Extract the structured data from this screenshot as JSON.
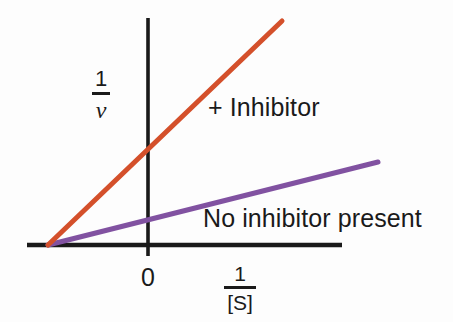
{
  "figure": {
    "kind": "lineweaver-burk-plot",
    "background_color": "#fdfdfd",
    "axis_color": "#1a1a1a",
    "origin_label": "0",
    "y_axis_label": {
      "numerator": "1",
      "denominator": "v"
    },
    "x_axis_label": {
      "numerator": "1",
      "denominator": "[S]"
    },
    "annotations": {
      "inhibitor": "+ Inhibitor",
      "no_inhibitor": "No inhibitor present"
    }
  },
  "chart_data": {
    "type": "line",
    "title": "",
    "subtitle": "",
    "xlabel": "1/[S]",
    "ylabel": "1/v",
    "grid": false,
    "legend_position": "inline-annotation",
    "axis_style": "crossed-axes-at-origin",
    "xlim": [
      -1.0,
      2.2
    ],
    "ylim": [
      0,
      2.5
    ],
    "origin_pixel": [
      148,
      245
    ],
    "annotations": [
      {
        "text": "+ Inhibitor",
        "series": "inhibitor",
        "x_px": 208,
        "y_px": 95
      },
      {
        "text": "No inhibitor present",
        "series": "no_inhibitor",
        "x_px": 203,
        "y_px": 206
      },
      {
        "text": "0",
        "role": "origin-tick",
        "x_px": 148,
        "y_px": 265
      }
    ],
    "series": [
      {
        "name": "+ Inhibitor",
        "color": "#d4502b",
        "stroke_width": 5,
        "x_intercept": -0.64,
        "y_intercept": 1.02,
        "slope": 1.6,
        "points_px": [
          [
            48,
            245
          ],
          [
            282,
            21
          ]
        ],
        "points_data": [
          [
            -0.64,
            0.0
          ],
          [
            1.42,
            2.36
          ]
        ]
      },
      {
        "name": "No inhibitor present",
        "color": "#8152a1",
        "stroke_width": 5,
        "x_intercept": -0.64,
        "y_intercept": 0.31,
        "slope": 0.48,
        "points_px": [
          [
            48,
            245
          ],
          [
            378,
            162
          ]
        ],
        "points_data": [
          [
            -0.64,
            0.0
          ],
          [
            2.02,
            0.87
          ]
        ]
      }
    ],
    "axes_px": {
      "x_axis": {
        "x1": 27,
        "y1": 245,
        "x2": 342,
        "y2": 245
      },
      "y_axis": {
        "x1": 148,
        "y1": 18,
        "x2": 148,
        "y2": 256
      }
    }
  }
}
